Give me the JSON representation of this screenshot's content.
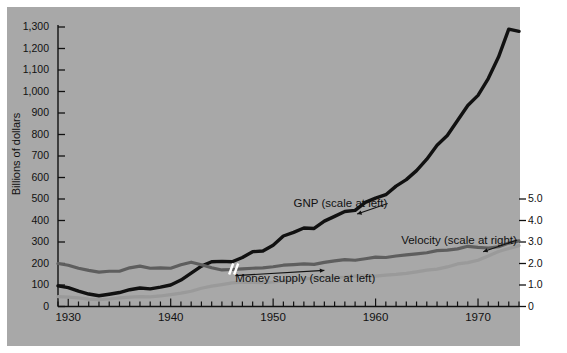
{
  "figure": {
    "background_color": "#a8a8a8",
    "plot_background_color": "#ffffff",
    "axis_title_left": "Billions of dollars"
  },
  "chart_data": {
    "type": "line",
    "title": "",
    "xlabel": "",
    "ylabel": "Billions of dollars",
    "ylabel_right": "",
    "grid": false,
    "legend": "annotations-on-plot",
    "xlim": [
      1929,
      1974
    ],
    "ylim": [
      0,
      1350
    ],
    "ylim_right": [
      0,
      5.4
    ],
    "x_tick_labels": [
      "1930",
      "1940",
      "1950",
      "1960",
      "1970"
    ],
    "x_tick_values": [
      1930,
      1940,
      1950,
      1960,
      1970
    ],
    "x_minor_tick_interval": 1,
    "y_tick_labels": [
      "0",
      "100",
      "200",
      "300",
      "400",
      "500",
      "600",
      "700",
      "800",
      "900",
      "1,000",
      "1,100",
      "1,200",
      "1,300"
    ],
    "y_tick_values": [
      0,
      100,
      200,
      300,
      400,
      500,
      600,
      700,
      800,
      900,
      1000,
      1100,
      1200,
      1300
    ],
    "y_right_tick_labels": [
      "0",
      "1.0",
      "2.0",
      "3.0",
      "4.0",
      "5.0"
    ],
    "y_right_tick_values": [
      0,
      1.0,
      2.0,
      3.0,
      4.0,
      5.0
    ],
    "annotations": [
      {
        "text": "GNP (scale at left)",
        "x": 1952.0,
        "y": 470,
        "anchor_x": 1958.2,
        "anchor_y": 430
      },
      {
        "text": "Velocity (scale at right)",
        "x": 1962.5,
        "y": 300,
        "anchor_x": 1970.5,
        "anchor_y": 255
      },
      {
        "text": "Money supply (scale at left)",
        "x": 1959.0,
        "y": 125,
        "anchor_x": 1955.0,
        "anchor_y": 168
      }
    ],
    "series": [
      {
        "name": "GNP (scale at left)",
        "axis": "left",
        "color": "#111111",
        "width": 3.4,
        "x": [
          1929,
          1930,
          1931,
          1932,
          1933,
          1934,
          1935,
          1936,
          1937,
          1938,
          1939,
          1940,
          1941,
          1942,
          1943,
          1944,
          1945,
          1946,
          1947,
          1948,
          1949,
          1950,
          1951,
          1952,
          1953,
          1954,
          1955,
          1956,
          1957,
          1958,
          1959,
          1960,
          1961,
          1962,
          1963,
          1964,
          1965,
          1966,
          1967,
          1968,
          1969,
          1970,
          1971,
          1972,
          1973,
          1974
        ],
        "values": [
          96,
          88,
          72,
          58,
          50,
          57,
          65,
          78,
          86,
          82,
          90,
          100,
          123,
          155,
          188,
          208,
          210,
          208,
          228,
          255,
          258,
          285,
          328,
          345,
          365,
          363,
          397,
          419,
          442,
          447,
          484,
          504,
          520,
          560,
          590,
          632,
          685,
          750,
          795,
          865,
          935,
          982,
          1060,
          1160,
          1290,
          1280
        ]
      },
      {
        "name": "Money supply (scale at left)",
        "axis": "left",
        "color": "#9a9a9a",
        "width": 3.2,
        "x": [
          1929,
          1930,
          1931,
          1932,
          1933,
          1934,
          1935,
          1936,
          1937,
          1938,
          1939,
          1940,
          1941,
          1942,
          1943,
          1944,
          1945,
          1946,
          1947,
          1948,
          1949,
          1950,
          1951,
          1952,
          1953,
          1954,
          1955,
          1956,
          1957,
          1958,
          1959,
          1960,
          1961,
          1962,
          1963,
          1964,
          1965,
          1966,
          1967,
          1968,
          1969,
          1970,
          1971,
          1972,
          1973,
          1974
        ],
        "values": [
          46,
          44,
          40,
          34,
          32,
          35,
          40,
          44,
          46,
          45,
          49,
          55,
          62,
          71,
          85,
          95,
          102,
          110,
          113,
          112,
          111,
          114,
          119,
          125,
          128,
          132,
          135,
          136,
          136,
          141,
          142,
          141,
          146,
          149,
          154,
          161,
          169,
          174,
          184,
          198,
          204,
          215,
          235,
          256,
          270,
          283
        ]
      },
      {
        "name": "Velocity (scale at right)",
        "axis": "right",
        "color": "#5e5e5e",
        "width": 3.2,
        "break_at_x": 1946,
        "x": [
          1929,
          1930,
          1931,
          1932,
          1933,
          1934,
          1935,
          1936,
          1937,
          1938,
          1939,
          1940,
          1941,
          1942,
          1943,
          1944,
          1945,
          1946,
          1947,
          1948,
          1949,
          1950,
          1951,
          1952,
          1953,
          1954,
          1955,
          1956,
          1957,
          1958,
          1959,
          1960,
          1961,
          1962,
          1963,
          1964,
          1965,
          1966,
          1967,
          1968,
          1969,
          1970,
          1971,
          1972,
          1973,
          1974
        ],
        "values": [
          2.0,
          1.92,
          1.78,
          1.68,
          1.6,
          1.64,
          1.64,
          1.8,
          1.88,
          1.78,
          1.8,
          1.78,
          1.94,
          2.06,
          1.94,
          1.8,
          1.7,
          1.72,
          1.75,
          1.78,
          1.8,
          1.85,
          1.92,
          1.95,
          1.98,
          1.96,
          2.05,
          2.12,
          2.18,
          2.15,
          2.22,
          2.3,
          2.28,
          2.35,
          2.4,
          2.45,
          2.5,
          2.6,
          2.62,
          2.68,
          2.8,
          2.75,
          2.72,
          2.78,
          2.95,
          3.05
        ]
      }
    ]
  }
}
